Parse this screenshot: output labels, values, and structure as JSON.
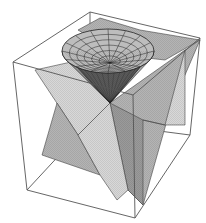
{
  "figure": {
    "title": "",
    "colors": {
      "background": "#ffffff",
      "box_edge": "#555555",
      "plane_light": "#d8d8d8",
      "plane_mid": "#b4b4b4",
      "plane_dark": "#9a9a9a",
      "cone_outer": "#bdbdbd",
      "cone_inner": "#5a5a5a",
      "mesh": "#222222"
    },
    "box": {
      "top_back_left": [
        90,
        12
      ],
      "top_back_right": [
        200,
        38
      ],
      "top_front_left": [
        13,
        62
      ],
      "top_front_right": [
        133,
        95
      ],
      "bottom_front_left": [
        27,
        190
      ],
      "bottom_front_right": [
        135,
        218
      ],
      "bottom_back_right": [
        190,
        135
      ],
      "bottom_back_left": [
        90,
        122
      ]
    },
    "planes": [
      {
        "name": "back-plane-top",
        "shade": "plane_mid",
        "points": [
          [
            78,
            30
          ],
          [
            100,
            18
          ],
          [
            140,
            30
          ],
          [
            200,
            40
          ],
          [
            165,
            60
          ],
          [
            120,
            55
          ]
        ]
      },
      {
        "name": "top-left-plane",
        "shade": "plane_light",
        "points": [
          [
            35,
            70
          ],
          [
            80,
            60
          ],
          [
            110,
            103
          ],
          [
            78,
            135
          ],
          [
            35,
            70
          ]
        ]
      },
      {
        "name": "right-plane",
        "shade": "plane_mid",
        "points": [
          [
            110,
            103
          ],
          [
            185,
            50
          ],
          [
            200,
            40
          ],
          [
            170,
            110
          ],
          [
            143,
            205
          ],
          [
            128,
            190
          ]
        ]
      },
      {
        "name": "right-front-face",
        "shade": "plane_dark",
        "points": [
          [
            110,
            103
          ],
          [
            143,
            120
          ],
          [
            143,
            205
          ],
          [
            128,
            190
          ]
        ]
      },
      {
        "name": "left-lower-plane",
        "shade": "plane_mid",
        "points": [
          [
            57,
            103
          ],
          [
            78,
            135
          ],
          [
            100,
            175
          ],
          [
            42,
            155
          ]
        ]
      },
      {
        "name": "center-lower-plane",
        "shade": "plane_light",
        "points": [
          [
            78,
            135
          ],
          [
            110,
            103
          ],
          [
            128,
            190
          ],
          [
            117,
            200
          ],
          [
            100,
            175
          ]
        ]
      },
      {
        "name": "right-ledge",
        "shade": "plane_light",
        "points": [
          [
            143,
            120
          ],
          [
            165,
            125
          ],
          [
            185,
            50
          ],
          [
            185,
            125
          ],
          [
            165,
            125
          ]
        ]
      }
    ],
    "cone": {
      "rim_center": [
        108,
        51
      ],
      "rim_rx": 46,
      "rim_ry": 22,
      "apex": [
        110,
        103
      ],
      "radial_lines": 16,
      "rings": 6
    }
  }
}
